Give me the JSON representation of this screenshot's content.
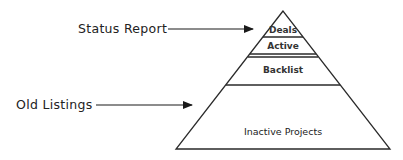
{
  "diagram": {
    "type": "pyramid",
    "colors": {
      "stroke": "#2a2a2a",
      "background": "#ffffff",
      "text": "#222222"
    },
    "tiers": [
      {
        "label": "Deals"
      },
      {
        "label": "Active"
      },
      {
        "label": "Backlist"
      },
      {
        "label": "Inactive Projects"
      }
    ],
    "callouts": [
      {
        "label": "Status Report",
        "points_to": "Deals"
      },
      {
        "label": "Old Listings",
        "points_to": "Inactive Projects"
      }
    ]
  }
}
